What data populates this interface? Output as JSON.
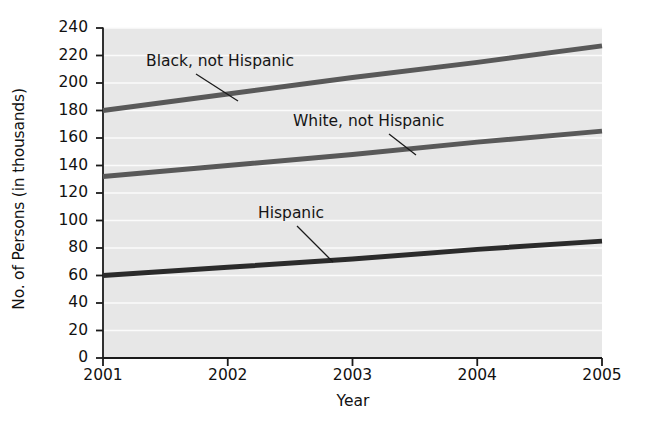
{
  "chart_data": {
    "type": "line",
    "title": "",
    "xlabel": "Year",
    "ylabel": "No. of Persons (in thousands)",
    "x": [
      2001,
      2002,
      2003,
      2004,
      2005
    ],
    "xtick_labels": [
      "2001",
      "2002",
      "2003",
      "2004",
      "2005"
    ],
    "xlim": [
      2001,
      2005
    ],
    "ylim": [
      0,
      240
    ],
    "ytick_labels": [
      "0",
      "20",
      "40",
      "60",
      "80",
      "100",
      "120",
      "140",
      "160",
      "180",
      "200",
      "220",
      "240"
    ],
    "ytick_values": [
      0,
      20,
      40,
      60,
      80,
      100,
      120,
      140,
      160,
      180,
      200,
      220,
      240
    ],
    "grid": "horizontal-white-gridlines",
    "legend": "inline-annotations-with-leader-lines",
    "plot_background": "#e7e7e7",
    "series": [
      {
        "name": "Black, not Hispanic",
        "values": [
          180,
          192,
          204,
          215,
          227
        ],
        "color": "#595959",
        "annotation": {
          "text": "Black, not Hispanic",
          "text_x": 146,
          "text_y": 66,
          "leader_from_x": 196,
          "leader_from_y": 74,
          "leader_to_x": 238,
          "leader_to_y": 101
        }
      },
      {
        "name": "White, not Hispanic",
        "values": [
          132,
          140,
          148,
          157,
          165
        ],
        "color": "#595959",
        "annotation": {
          "text": "White, not Hispanic",
          "text_x": 293,
          "text_y": 126,
          "leader_from_x": 389,
          "leader_from_y": 134,
          "leader_to_x": 416,
          "leader_to_y": 155
        }
      },
      {
        "name": "Hispanic",
        "values": [
          60,
          66,
          72,
          79,
          85
        ],
        "color": "#2b2b2b",
        "annotation": {
          "text": "Hispanic",
          "text_x": 258,
          "text_y": 218,
          "leader_from_x": 297,
          "leader_from_y": 226,
          "leader_to_x": 333,
          "leader_to_y": 262
        }
      }
    ]
  },
  "axes": {
    "y_title": "No. of Persons (in thousands)",
    "x_title": "Year"
  }
}
